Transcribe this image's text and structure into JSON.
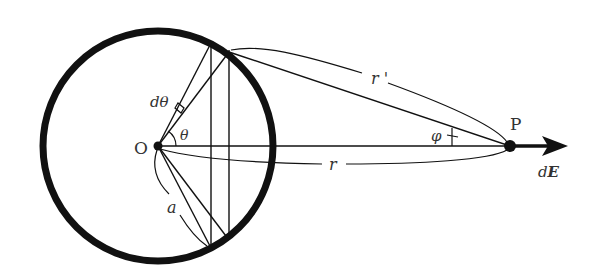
{
  "diagram": {
    "labels": {
      "origin": "O",
      "point": "P",
      "dtheta": "dθ",
      "theta": "θ",
      "radius": "a",
      "r_prime": "r '",
      "r": "r",
      "phi": "φ",
      "dE_d": "d",
      "dE_E": "E"
    },
    "geometry": {
      "circle_center": [
        158,
        146
      ],
      "circle_radius": 116,
      "point_P": [
        510,
        146
      ],
      "arrow_tip": [
        568,
        146
      ]
    },
    "colors": {
      "stroke": "#111111",
      "text": "#333333",
      "background": "#ffffff"
    }
  }
}
